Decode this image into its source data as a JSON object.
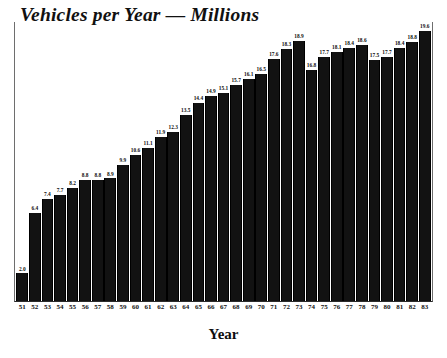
{
  "chart_data": {
    "type": "bar",
    "title": "Vehicles per Year — Millions",
    "xlabel": "Year",
    "ylabel": "",
    "ylim": [
      0,
      19.6
    ],
    "grid": false,
    "legend": null,
    "value_labels_shown": true,
    "categories": [
      "51",
      "52",
      "53",
      "54",
      "55",
      "56",
      "57",
      "58",
      "59",
      "60",
      "61",
      "62",
      "63",
      "64",
      "65",
      "66",
      "67",
      "68",
      "69",
      "70",
      "71",
      "72",
      "73",
      "74",
      "75",
      "76",
      "77",
      "78",
      "79",
      "80",
      "81",
      "82",
      "83"
    ],
    "values": [
      2.0,
      6.4,
      7.4,
      7.7,
      8.2,
      8.8,
      8.8,
      8.9,
      9.9,
      10.6,
      11.1,
      11.9,
      12.3,
      13.5,
      14.4,
      14.9,
      15.1,
      15.7,
      16.1,
      16.5,
      17.6,
      18.3,
      18.9,
      16.8,
      17.7,
      18.1,
      18.4,
      18.6,
      17.5,
      17.7,
      18.4,
      18.8,
      19.6
    ],
    "value_text": [
      "2.0",
      "6.4",
      "7.4",
      "7.7",
      "8.2",
      "8.8",
      "8.8",
      "8.9",
      "9.9",
      "10.6",
      "11.1",
      "11.9",
      "12.3",
      "13.5",
      "14.4",
      "14.9",
      "15.1",
      "15.7",
      "16.1",
      "16.5",
      "17.6",
      "18.3",
      "18.9",
      "16.8",
      "17.7",
      "18.1",
      "18.4",
      "18.6",
      "17.5",
      "17.7",
      "18.4",
      "18.8",
      "19.6"
    ],
    "bar_color": "#121212",
    "background_color": "#ffffff",
    "text_color": "#111111"
  }
}
